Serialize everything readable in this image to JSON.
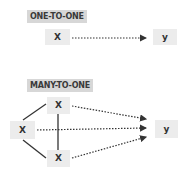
{
  "diagram": {
    "one_to_one": {
      "title": "ONE-TO-ONE",
      "source": "X",
      "target": "y"
    },
    "many_to_one": {
      "title": "MANY-TO-ONE",
      "sources": [
        "X",
        "X",
        "X"
      ],
      "target": "y"
    },
    "colors": {
      "label_bg": "#d7d7d7",
      "node_bg": "#ececec",
      "line": "#333333"
    }
  }
}
